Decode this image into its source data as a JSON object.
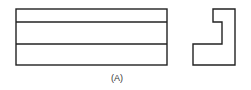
{
  "diagram": {
    "caption": "(A)",
    "stroke_color": "#222222",
    "front_view": {
      "x": 16,
      "y": 9,
      "width": 151,
      "height": 56,
      "horizontal_lines_y": [
        22,
        44
      ]
    },
    "side_view": {
      "points": "213,9 235,9 235,65 193,65 193,44 222,44 222,22 213,22"
    }
  }
}
